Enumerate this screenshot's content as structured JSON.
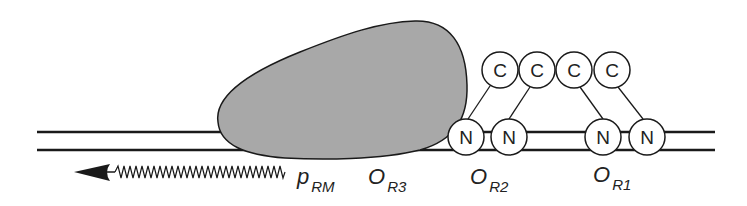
{
  "diagram": {
    "colors": {
      "line": "#1a1a1a",
      "polymerase_fill": "#a8a8a8",
      "circle_fill": "#ffffff",
      "background": "#ffffff"
    },
    "dna": {
      "strand_top_y": 132,
      "strand_bottom_y": 150,
      "x_start": 37,
      "x_end": 715
    },
    "polymerase": {
      "label": "RNA polymerase (shaded blob)"
    },
    "n_domains": [
      {
        "label": "N",
        "cx": 466,
        "cy": 137
      },
      {
        "label": "N",
        "cx": 509,
        "cy": 137
      },
      {
        "label": "N",
        "cx": 603,
        "cy": 137
      },
      {
        "label": "N",
        "cx": 647,
        "cy": 137
      }
    ],
    "c_domains": [
      {
        "label": "C",
        "cx": 500,
        "cy": 70
      },
      {
        "label": "C",
        "cx": 537,
        "cy": 70
      },
      {
        "label": "C",
        "cx": 574,
        "cy": 70
      },
      {
        "label": "C",
        "cx": 612,
        "cy": 70
      }
    ],
    "labels": {
      "prm_main": "p",
      "prm_sub": "RM",
      "or3_main": "O",
      "or3_sub": "R3",
      "or2_main": "O",
      "or2_sub": "R2",
      "or1_main": "O",
      "or1_sub": "R1"
    },
    "transcript": {
      "direction": "leftward",
      "label": "mRNA transcript arrow"
    }
  }
}
